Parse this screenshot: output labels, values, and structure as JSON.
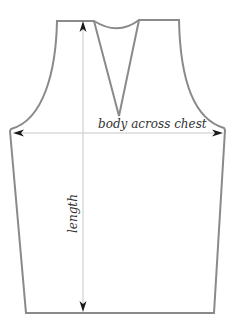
{
  "diagram": {
    "colors": {
      "outline": "#8a8a8a",
      "guide": "#c8c8c8",
      "arrow": "#1a1a1a",
      "text": "#333333",
      "background": "#ffffff"
    },
    "measurements": [
      {
        "id": "chest",
        "label": "body across chest",
        "orientation": "horizontal"
      },
      {
        "id": "length",
        "label": "length",
        "orientation": "vertical"
      }
    ]
  }
}
